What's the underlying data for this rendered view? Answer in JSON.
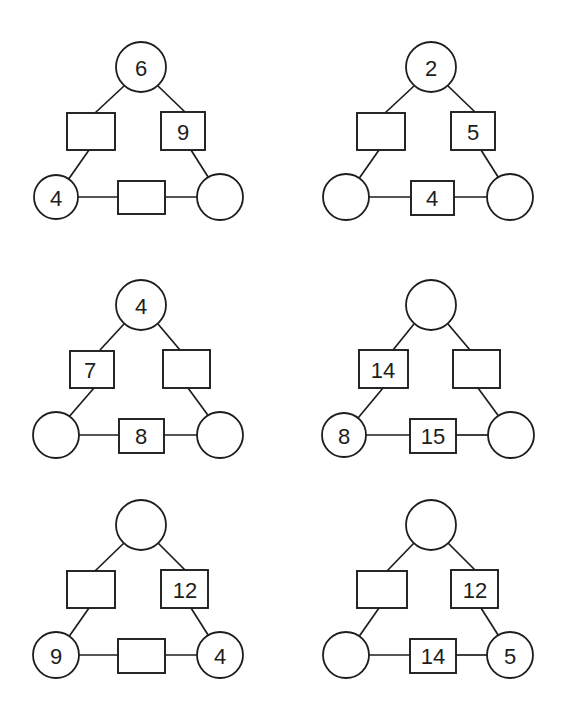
{
  "page": {
    "background_color": "#ffffff",
    "stroke_color": "#1d1d1b",
    "fill_color": "#ffffff",
    "columns": 2,
    "rows": 3,
    "puzzle_count": 6
  },
  "shape_legend": {
    "circle_role": "corner",
    "square_role": "edge",
    "blank_meaning": "empty node to be filled in"
  },
  "puzzles": [
    {
      "id": "puzzle-1",
      "position": "row-1-left",
      "nodes": {
        "top_circle": "6",
        "left_square": "",
        "right_square": "9",
        "bottom_left_circle": "4",
        "bottom_square": "",
        "bottom_right_circle": ""
      }
    },
    {
      "id": "puzzle-2",
      "position": "row-1-right",
      "nodes": {
        "top_circle": "2",
        "left_square": "",
        "right_square": "5",
        "bottom_left_circle": "",
        "bottom_square": "4",
        "bottom_right_circle": ""
      }
    },
    {
      "id": "puzzle-3",
      "position": "row-2-left",
      "nodes": {
        "top_circle": "4",
        "left_square": "7",
        "right_square": "",
        "bottom_left_circle": "",
        "bottom_square": "8",
        "bottom_right_circle": ""
      }
    },
    {
      "id": "puzzle-4",
      "position": "row-2-right",
      "nodes": {
        "top_circle": "",
        "left_square": "14",
        "right_square": "",
        "bottom_left_circle": "8",
        "bottom_square": "15",
        "bottom_right_circle": ""
      }
    },
    {
      "id": "puzzle-5",
      "position": "row-3-left",
      "nodes": {
        "top_circle": "",
        "left_square": "",
        "right_square": "12",
        "bottom_left_circle": "9",
        "bottom_square": "",
        "bottom_right_circle": "4"
      }
    },
    {
      "id": "puzzle-6",
      "position": "row-3-right",
      "nodes": {
        "top_circle": "",
        "left_square": "",
        "right_square": "12",
        "bottom_left_circle": "",
        "bottom_square": "14",
        "bottom_right_circle": "5"
      }
    }
  ]
}
